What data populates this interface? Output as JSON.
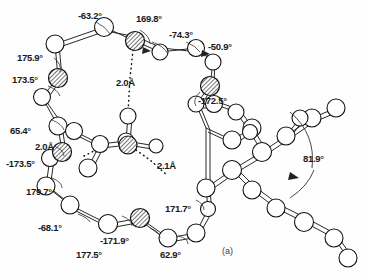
{
  "figure": {
    "caption": "(a)",
    "type": "ball-and-stick molecular structure",
    "units": {
      "angle": "°",
      "distance": "Å"
    }
  },
  "torsion_angles": [
    {
      "id": "t1",
      "value": "-63.2°",
      "x": 78,
      "y": 10
    },
    {
      "id": "t2",
      "value": "169.8°",
      "x": 136,
      "y": 13
    },
    {
      "id": "t3",
      "value": "-74.3°",
      "x": 169,
      "y": 29
    },
    {
      "id": "t4",
      "value": "-50.9°",
      "x": 208,
      "y": 41
    },
    {
      "id": "t5",
      "value": "175.9°",
      "x": 17,
      "y": 52
    },
    {
      "id": "t6",
      "value": "173.5°",
      "x": 12,
      "y": 74
    },
    {
      "id": "t7",
      "value": "-172.5°",
      "x": 198,
      "y": 95
    },
    {
      "id": "t8",
      "value": "65.4°",
      "x": 10,
      "y": 125
    },
    {
      "id": "t9",
      "value": "-173.5°",
      "x": 6,
      "y": 158
    },
    {
      "id": "t10",
      "value": "179.7°",
      "x": 26,
      "y": 186
    },
    {
      "id": "t11",
      "value": "-68.1°",
      "x": 38,
      "y": 222
    },
    {
      "id": "t12",
      "value": "-171.9°",
      "x": 100,
      "y": 235
    },
    {
      "id": "t13",
      "value": "177.5°",
      "x": 76,
      "y": 249
    },
    {
      "id": "t14",
      "value": "62.9°",
      "x": 160,
      "y": 249
    },
    {
      "id": "t15",
      "value": "171.7°",
      "x": 165,
      "y": 203
    },
    {
      "id": "t16",
      "value": "81.9°",
      "x": 303,
      "y": 153
    }
  ],
  "hydrogen_bonds": [
    {
      "id": "h1",
      "value": "2.0Å",
      "x": 116,
      "y": 77
    },
    {
      "id": "h2",
      "value": "2.0Å",
      "x": 35,
      "y": 141
    },
    {
      "id": "h3",
      "value": "2.1Å",
      "x": 157,
      "y": 160
    }
  ]
}
